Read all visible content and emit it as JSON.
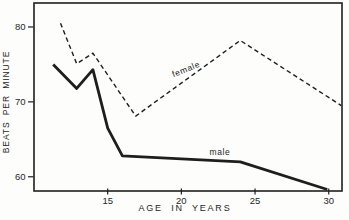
{
  "chart_data": {
    "type": "line",
    "title": "",
    "xlabel": "AGE IN YEARS",
    "ylabel": "BEATS PER MINUTE",
    "xlim": [
      10,
      30.9
    ],
    "ylim": [
      58.1,
      83.2
    ],
    "x_ticks": [
      15,
      20,
      25,
      30
    ],
    "y_ticks": [
      60,
      70,
      80
    ],
    "grid": false,
    "legend": "inline labels written on the lines",
    "series": [
      {
        "name": "female",
        "label": "female",
        "line_style": "dashed",
        "points": [
          [
            11.8,
            80.5
          ],
          [
            12.9,
            75.1
          ],
          [
            14,
            76.5
          ],
          [
            16.9,
            68.1
          ],
          [
            24,
            78.2
          ],
          [
            30.85,
            69.5
          ]
        ],
        "label_anchor": {
          "age": 20.3,
          "bpm": 74.6,
          "angle_deg": -22
        }
      },
      {
        "name": "male",
        "label": "male",
        "line_style": "solid",
        "points": [
          [
            11.3,
            75.0
          ],
          [
            12.9,
            71.8
          ],
          [
            14,
            74.3
          ],
          [
            15,
            66.5
          ],
          [
            16,
            62.8
          ],
          [
            24,
            62.0
          ],
          [
            29.9,
            58.3
          ]
        ],
        "label_anchor": {
          "age": 22.6,
          "bpm": 63.2,
          "angle_deg": 0
        }
      }
    ],
    "colors": {
      "line": "#1e1e1e",
      "text": "#262626",
      "background": "#fdfdfc"
    }
  }
}
